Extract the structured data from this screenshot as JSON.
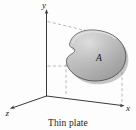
{
  "figure": {
    "caption": "Thin plate",
    "axes": {
      "y_label": "y",
      "z_label": "z",
      "x_label": "x"
    },
    "region": {
      "label": "A",
      "fill_color": "#b4b4b4",
      "edge_color": "#4a4a4a",
      "highlight_color": "#d8d8d8"
    },
    "colors": {
      "axis": "#3a3a3a",
      "dashed": "#8a8a8a",
      "background": "#fdfdfd",
      "text": "#1a1a1a"
    }
  }
}
